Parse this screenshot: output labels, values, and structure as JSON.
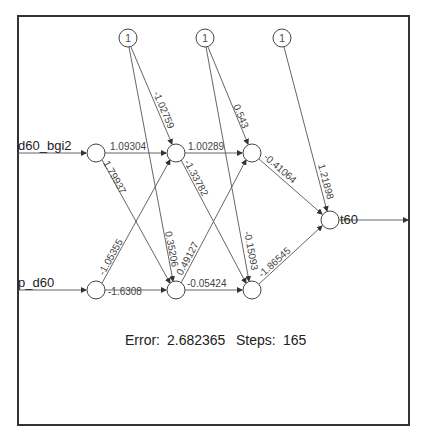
{
  "diagram": {
    "type": "neural-network",
    "inputs": [
      {
        "id": "in1",
        "label": "d60_bgi2"
      },
      {
        "id": "in2",
        "label": "p_d60"
      }
    ],
    "bias_nodes": [
      {
        "id": "b1",
        "label": "1"
      },
      {
        "id": "b2",
        "label": "1"
      },
      {
        "id": "b3",
        "label": "1"
      }
    ],
    "output": {
      "id": "out",
      "label": "t60"
    },
    "weights": {
      "in1_h1a": "1.09304",
      "in1_h1b": "1.79937",
      "in2_h1a": "-1.05355",
      "in2_h1b": "-1.6308",
      "b1_h1a": "-1.02759",
      "b1_h1b": "0.35206",
      "h1a_h2a": "1.00289",
      "h1a_h2b": "-1.33782",
      "h1b_h2a": "0.49127",
      "h1b_h2b": "-0.05424",
      "b2_h2a": "0.543",
      "b2_h2b": "-0.15093",
      "h2a_out": "-0.41064",
      "h2b_out": "-1.86545",
      "b3_out": "1.21898"
    },
    "summary": {
      "error_label": "Error:",
      "error_value": "2.682365",
      "steps_label": "Steps:",
      "steps_value": "165"
    }
  }
}
